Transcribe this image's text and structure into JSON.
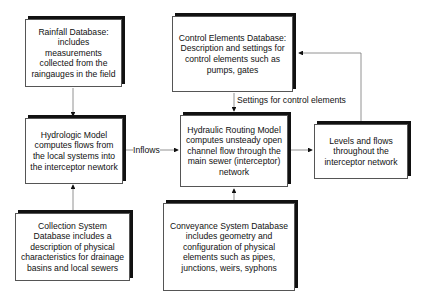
{
  "diagram": {
    "nodes": {
      "rainfall": {
        "text": "Rainfall Database: includes measurements collected from the raingauges in the field"
      },
      "control": {
        "text": "Control Elements  Database: Description and settings for control elements such as pumps, gates"
      },
      "hydrologic": {
        "text": "Hydrologic Model computes flows from the local systems into the interceptor newtork"
      },
      "hydraulic": {
        "text": "Hydraulic Routing Model computes unsteady open channel flow through the main sewer (interceptor) network"
      },
      "levels": {
        "text": "Levels and flows throughout the interceptor network"
      },
      "collection": {
        "text": "Collection System Database includes a description of physical characteristics for drainage basins and local sewers"
      },
      "conveyance": {
        "text": "Conveyance System Database includes geometry and configuration of physical elements such as pipes, junctions, weirs, syphons"
      }
    },
    "edges": {
      "inflows": {
        "label": "Inflows",
        "from": "hydrologic",
        "to": "hydraulic"
      },
      "settings": {
        "label": "Settings for control elements",
        "from": "control",
        "to": "hydraulic"
      },
      "rain_to_hydro": {
        "from": "rainfall",
        "to": "hydrologic"
      },
      "collection_to_hydro": {
        "from": "collection",
        "to": "hydrologic"
      },
      "conveyance_to_hydraulic": {
        "from": "conveyance",
        "to": "hydraulic"
      },
      "hydraulic_to_levels": {
        "from": "hydraulic",
        "to": "levels"
      },
      "levels_to_control": {
        "from": "levels",
        "to": "control"
      }
    }
  }
}
